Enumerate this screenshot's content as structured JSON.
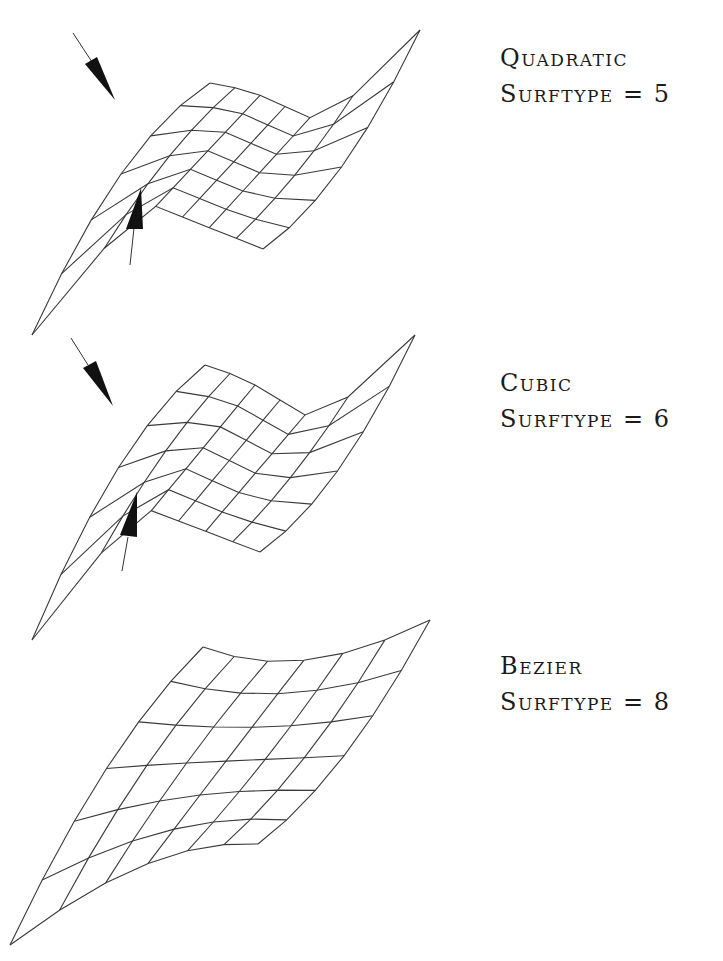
{
  "figures": [
    {
      "name": "Quadratic",
      "surftype_label": "Surftype = 5",
      "surftype_value": 5,
      "has_arrows": true
    },
    {
      "name": "Cubic",
      "surftype_label": "Surftype = 6",
      "surftype_value": 6,
      "has_arrows": true
    },
    {
      "name": "Bezier",
      "surftype_label": "Surftype = 8",
      "surftype_value": 8,
      "has_arrows": false
    }
  ],
  "colors": {
    "background": "#ffffff",
    "line": "#3a3a3a",
    "arrow": "#111111",
    "text": "#1a1a1a"
  }
}
